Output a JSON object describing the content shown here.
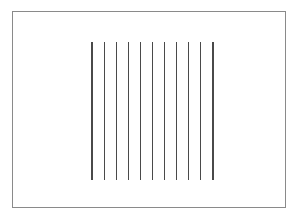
{
  "figure": {
    "canvas": {
      "width": 297,
      "height": 221,
      "background_color": "#ffffff"
    },
    "frame": {
      "name": "outer-rectangle-border",
      "x": 12,
      "y": 11.5,
      "width": 273,
      "height": 196,
      "stroke_color": "#8a8a8a",
      "stroke_width": 1,
      "fill": "none"
    },
    "line_group": {
      "name": "vertical-line-array",
      "count": 11,
      "top_y": 42,
      "bottom_y": 180,
      "first_x": 92,
      "last_x": 213,
      "spacing": 12.1,
      "stroke_color": "#4a4a4a",
      "stroke_width": 1.1,
      "lines": [
        {
          "index": 1,
          "x": 92,
          "y1": 42,
          "y2": 180
        },
        {
          "index": 2,
          "x": 104.1,
          "y1": 42,
          "y2": 180
        },
        {
          "index": 3,
          "x": 116.2,
          "y1": 42,
          "y2": 180
        },
        {
          "index": 4,
          "x": 128.3,
          "y1": 42,
          "y2": 180
        },
        {
          "index": 5,
          "x": 140.4,
          "y1": 42,
          "y2": 180
        },
        {
          "index": 6,
          "x": 152.5,
          "y1": 42,
          "y2": 180
        },
        {
          "index": 7,
          "x": 164.6,
          "y1": 42,
          "y2": 180
        },
        {
          "index": 8,
          "x": 176.7,
          "y1": 42,
          "y2": 180
        },
        {
          "index": 9,
          "x": 188.8,
          "y1": 42,
          "y2": 180
        },
        {
          "index": 10,
          "x": 200.9,
          "y1": 42,
          "y2": 180
        },
        {
          "index": 11,
          "x": 213,
          "y1": 42,
          "y2": 180
        }
      ]
    }
  }
}
